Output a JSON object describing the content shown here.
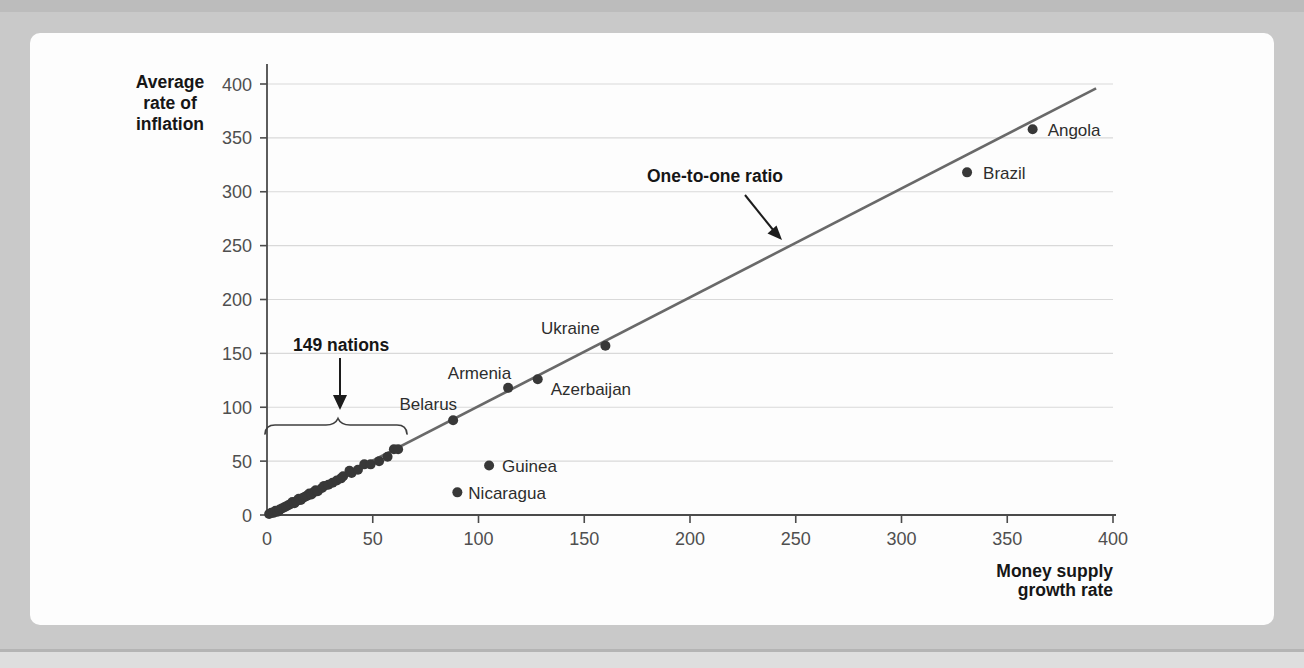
{
  "page": {
    "background_color": "#c9c9c9",
    "top_strip_color": "#bcbcbc",
    "bottom_strip_color": "#dedede",
    "card_color": "#fdfdfd"
  },
  "colors": {
    "grid": "#d9d9d9",
    "axis": "#4b4b4b",
    "tick_text": "#4f4f4f",
    "line": "#696969",
    "dot": "#383838",
    "point_label": "#2d2d2d",
    "annotation": "#161616"
  },
  "chart_data": {
    "type": "scatter",
    "title": "",
    "xlabel": "Money supply\ngrowth rate",
    "ylabel": "Average\nrate of\ninflation",
    "xlim": [
      0,
      400
    ],
    "ylim": [
      0,
      400
    ],
    "xticks": [
      0,
      50,
      100,
      150,
      200,
      250,
      300,
      350,
      400
    ],
    "yticks": [
      0,
      50,
      100,
      150,
      200,
      250,
      300,
      350,
      400
    ],
    "grid": "horizontal",
    "line": {
      "label": "One-to-one ratio",
      "x1": 0,
      "y1": 0,
      "x2": 392,
      "y2": 396
    },
    "labeled_points": [
      {
        "name": "Angola",
        "x": 362,
        "y": 358
      },
      {
        "name": "Brazil",
        "x": 331,
        "y": 318
      },
      {
        "name": "Ukraine",
        "x": 160,
        "y": 157
      },
      {
        "name": "Azerbaijan",
        "x": 128,
        "y": 126
      },
      {
        "name": "Armenia",
        "x": 114,
        "y": 118
      },
      {
        "name": "Belarus",
        "x": 88,
        "y": 88
      },
      {
        "name": "Guinea",
        "x": 105,
        "y": 46
      },
      {
        "name": "Nicaragua",
        "x": 90,
        "y": 21
      }
    ],
    "cluster": {
      "label": "149 nations",
      "points": [
        [
          1,
          1
        ],
        [
          2,
          2
        ],
        [
          3,
          2
        ],
        [
          4,
          4
        ],
        [
          5,
          3
        ],
        [
          6,
          5
        ],
        [
          7,
          6
        ],
        [
          8,
          7
        ],
        [
          9,
          8
        ],
        [
          10,
          9
        ],
        [
          11,
          10
        ],
        [
          12,
          12
        ],
        [
          13,
          11
        ],
        [
          14,
          13
        ],
        [
          15,
          15
        ],
        [
          16,
          14
        ],
        [
          17,
          16
        ],
        [
          18,
          17
        ],
        [
          19,
          18
        ],
        [
          20,
          20
        ],
        [
          21,
          19
        ],
        [
          22,
          21
        ],
        [
          23,
          23
        ],
        [
          24,
          22
        ],
        [
          26,
          25
        ],
        [
          27,
          27
        ],
        [
          29,
          28
        ],
        [
          31,
          30
        ],
        [
          33,
          32
        ],
        [
          35,
          34
        ],
        [
          36,
          36
        ],
        [
          39,
          41
        ],
        [
          40,
          39
        ],
        [
          43,
          42
        ],
        [
          46,
          47
        ],
        [
          49,
          47
        ],
        [
          53,
          50
        ],
        [
          57,
          54
        ],
        [
          60,
          61
        ],
        [
          62,
          61
        ]
      ]
    },
    "annotations": {
      "line_label": "One-to-one ratio",
      "cluster_label": "149 nations"
    }
  }
}
